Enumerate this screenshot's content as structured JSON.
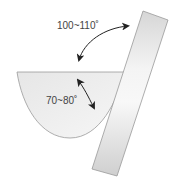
{
  "diagram": {
    "title": "",
    "labels": {
      "outer_angle": "100~110˚",
      "inner_angle": "70~80˚"
    },
    "elements": [
      {
        "name": "bowl",
        "description": "half-elliptical bowl shape"
      },
      {
        "name": "plate",
        "description": "tilted rectangular plate leaning against bowl"
      },
      {
        "name": "outer-angle-arrow",
        "description": "double-headed curved arrow between bowl top and plate"
      },
      {
        "name": "inner-angle-arrow",
        "description": "double-headed arrow inside bowl"
      }
    ],
    "colors": {
      "bowl_fill": "#ececec",
      "plate_fill": "#d9d9d9",
      "stroke": "#999999",
      "arrow": "#222222",
      "text": "#444444"
    }
  }
}
